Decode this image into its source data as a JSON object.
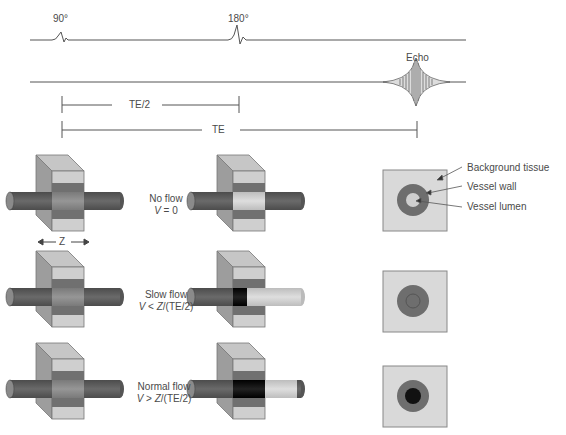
{
  "timing": {
    "pulse_90": "90°",
    "pulse_180": "180°",
    "echo": "Echo",
    "te_half": "TE/2",
    "te": "TE"
  },
  "slice_label": "Z",
  "rows": [
    {
      "title": "No flow",
      "v": "V",
      "cond": " = 0"
    },
    {
      "title": "Slow flow",
      "v": "V",
      "cond": " < ",
      "z": "Z",
      "tail": "/(TE/2)"
    },
    {
      "title": "Normal flow",
      "v": "V",
      "cond": " > ",
      "z": "Z",
      "tail": "/(TE/2)"
    }
  ],
  "legend": {
    "background": "Background tissue",
    "wall": "Vessel wall",
    "lumen": "Vessel lumen"
  },
  "colors": {
    "tissue": "#d9d9d9",
    "wall": "#6e6e6e",
    "lumen_bright": "#cfcfcf",
    "lumen_dark": "#111111",
    "tube": "#5a5a5a"
  }
}
